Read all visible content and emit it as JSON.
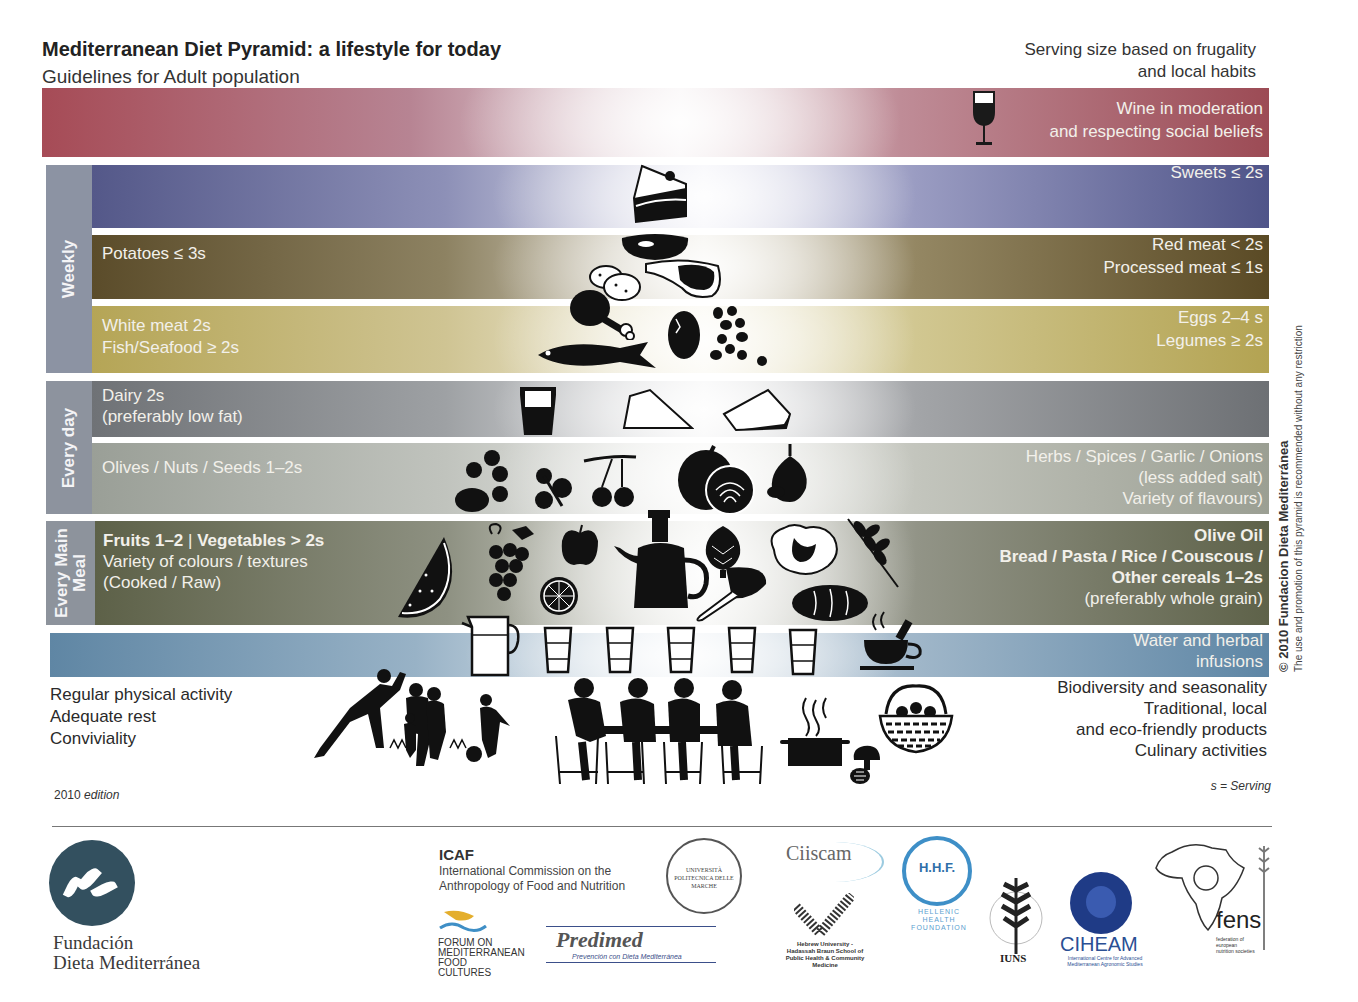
{
  "header": {
    "title": "Mediterranean Diet Pyramid: a lifestyle for today",
    "subtitle": "Guidelines for Adult population",
    "serving_note_line1": "Serving size based on frugality",
    "serving_note_line2": "and local habits"
  },
  "frequency_labels": {
    "weekly": "Weekly",
    "every_day": "Every day",
    "every_main_meal_line1": "Every Main",
    "every_main_meal_line2": "Meal"
  },
  "bands": {
    "wine": {
      "right_line1": "Wine in moderation",
      "right_line2": "and respecting social beliefs",
      "color": "#a64b56"
    },
    "sweets": {
      "right_line1": "Sweets ≤ 2s",
      "color": "#545889"
    },
    "red_meat": {
      "left_line1": "Potatoes ≤ 3s",
      "right_line1": "Red meat < 2s",
      "right_line2": "Processed meat ≤ 1s",
      "color": "#5b4c2a"
    },
    "white_meat": {
      "left_line1": "White meat 2s",
      "left_line2": "Fish/Seafood ≥ 2s",
      "right_line1": "Eggs 2–4 s",
      "right_line2": "Legumes ≥ 2s",
      "color": "#b5a556"
    },
    "dairy": {
      "left_line1": "Dairy 2s",
      "left_line2": "(preferably low fat)",
      "color": "#6f7276"
    },
    "olives": {
      "left_line1": "Olives / Nuts / Seeds 1–2s",
      "right_line1": "Herbs / Spices / Garlic / Onions",
      "right_line2": "(less added salt)",
      "right_line3": "Variety of flavours)",
      "color": "#9a9f97"
    },
    "fruits": {
      "left_bold_a": "Fruits 1–2",
      "left_separator": "|",
      "left_bold_b": "Vegetables > 2s",
      "left_line2": "Variety of colours / textures",
      "left_line3": "(Cooked / Raw)",
      "right_line1": "Olive Oil",
      "right_line2": "Bread / Pasta / Rice / Couscous /",
      "right_line3": "Other cereals 1–2s",
      "right_line4": "(preferably whole grain)",
      "color": "#5d6148"
    },
    "water": {
      "right_line1": "Water and herbal",
      "right_line2": "infusions",
      "color": "#5f86a4"
    }
  },
  "lifestyle": {
    "left": [
      "Regular physical activity",
      "Adequate rest",
      "Conviviality"
    ],
    "right": [
      "Biodiversity and seasonality",
      "Traditional, local",
      "and eco-friendly products",
      "Culinary activities"
    ]
  },
  "edition": {
    "year": "2010",
    "word": "edition"
  },
  "legend": "s = Serving",
  "copyright": {
    "line1": "© 2010 Fundacion Dieta Mediterránea",
    "line2": "The use and promotion of this pyramid is recommended without any restriction"
  },
  "pictograms": {
    "wine_glass": "wine-glass",
    "cake": "cake-slice",
    "sausage": "sausage",
    "potatoes": "potatoes",
    "steak": "steak",
    "chicken_leg": "chicken-leg",
    "fish": "fish",
    "egg": "egg",
    "beans": "beans",
    "yogurt": "yogurt-cup",
    "cheese_1": "cheese-wedge",
    "cheese_2": "cheese-wedge",
    "nuts": "nuts",
    "parsley": "herb",
    "olives": "olives",
    "onion": "onion",
    "garlic": "garlic",
    "watermelon": "watermelon",
    "grapes": "grapes",
    "apple": "apple",
    "orange": "orange-slice",
    "oil_jug": "olive-oil-cruet",
    "artichoke": "artichoke",
    "lettuce": "lettuce",
    "chard": "leafy-vegetable",
    "wheat": "wheat",
    "bread": "bread",
    "pitcher": "water-pitcher",
    "glasses": 6,
    "tea_cup": "herbal-tea",
    "family_activity": "family-activity",
    "family_meal": "family-meal",
    "cooking_pot": "cooking-pot",
    "mushrooms": "mushrooms",
    "basket": "basket"
  },
  "footer": {
    "foundation_line1": "Fundación",
    "foundation_line2": "Dieta Mediterránea",
    "icaf_title": "ICAF",
    "icaf_sub_line1": "International Commission on the",
    "icaf_sub_line2": "Anthropology of Food and Nutrition",
    "forum_line1": "FORUM ON",
    "forum_line2": "MEDITERRANEAN",
    "forum_line3": "FOOD CULTURES",
    "predimed": "Predimed",
    "predimed_sub": "Prevención con Dieta Mediterránea",
    "univpm": "UNIVERSITÀ POLITECNICA DELLE MARCHE",
    "ciiscam": "Ciiscam",
    "hebrew_univ": "Hebrew University - Hadassah Braun School of Public Health & Community Medicine",
    "hhf": "H.H.F.",
    "hhf_sub_line1": "HELLENIC",
    "hhf_sub_line2": "HEALTH",
    "hhf_sub_line3": "FOUNDATION",
    "iuns": "IUNS",
    "ciheam": "CIHEAM",
    "ciheam_sub": "International Centre for Advanced Mediterranean Agronomic Studies",
    "fens": "fens",
    "fens_sub": "federation of european nutrition societies"
  }
}
